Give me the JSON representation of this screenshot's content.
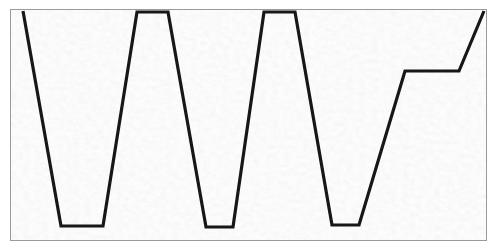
{
  "figure": {
    "title": "",
    "frame": {
      "x": 10,
      "y": 9,
      "width": 477,
      "height": 232,
      "border_color": "#9a9a9a",
      "border_width": 1
    },
    "background_color": "#e4e4e4",
    "texture_color_light": "#f6f6f6",
    "texture_color_dark": "#cfcfcf"
  },
  "chart_data": {
    "type": "line",
    "title": "",
    "xlabel": "",
    "ylabel": "",
    "grid": false,
    "legend": null,
    "xlim": [
      10,
      487
    ],
    "ylim": [
      9,
      241
    ],
    "line_color": "#171717",
    "line_width": 3.2,
    "series": [
      {
        "name": "profile-trace",
        "points": [
          [
            22,
            10
          ],
          [
            60,
            225
          ],
          [
            102,
            225
          ],
          [
            136,
            11
          ],
          [
            167,
            11
          ],
          [
            205,
            226
          ],
          [
            232,
            226
          ],
          [
            263,
            11
          ],
          [
            294,
            11
          ],
          [
            331,
            224
          ],
          [
            358,
            224
          ],
          [
            404,
            70
          ],
          [
            458,
            70
          ],
          [
            483,
            10
          ]
        ]
      }
    ],
    "annotations": [
      {
        "name": "peak-1-left-edge",
        "x": 22,
        "y": 10,
        "kind": "top-open"
      },
      {
        "name": "valley-1",
        "x_start": 60,
        "x_end": 102,
        "y": 225,
        "kind": "flat-bottom"
      },
      {
        "name": "peak-2",
        "x_start": 136,
        "x_end": 167,
        "y": 11,
        "kind": "flat-top"
      },
      {
        "name": "valley-2",
        "x_start": 205,
        "x_end": 232,
        "y": 226,
        "kind": "flat-bottom"
      },
      {
        "name": "peak-3",
        "x_start": 263,
        "x_end": 294,
        "y": 11,
        "kind": "flat-top"
      },
      {
        "name": "valley-3",
        "x_start": 331,
        "x_end": 358,
        "y": 224,
        "kind": "flat-bottom"
      },
      {
        "name": "step-shelf",
        "x_start": 404,
        "x_end": 458,
        "y": 70,
        "kind": "flat-shelf"
      },
      {
        "name": "final-rise-end",
        "x": 483,
        "y": 10,
        "kind": "top-open"
      }
    ]
  }
}
